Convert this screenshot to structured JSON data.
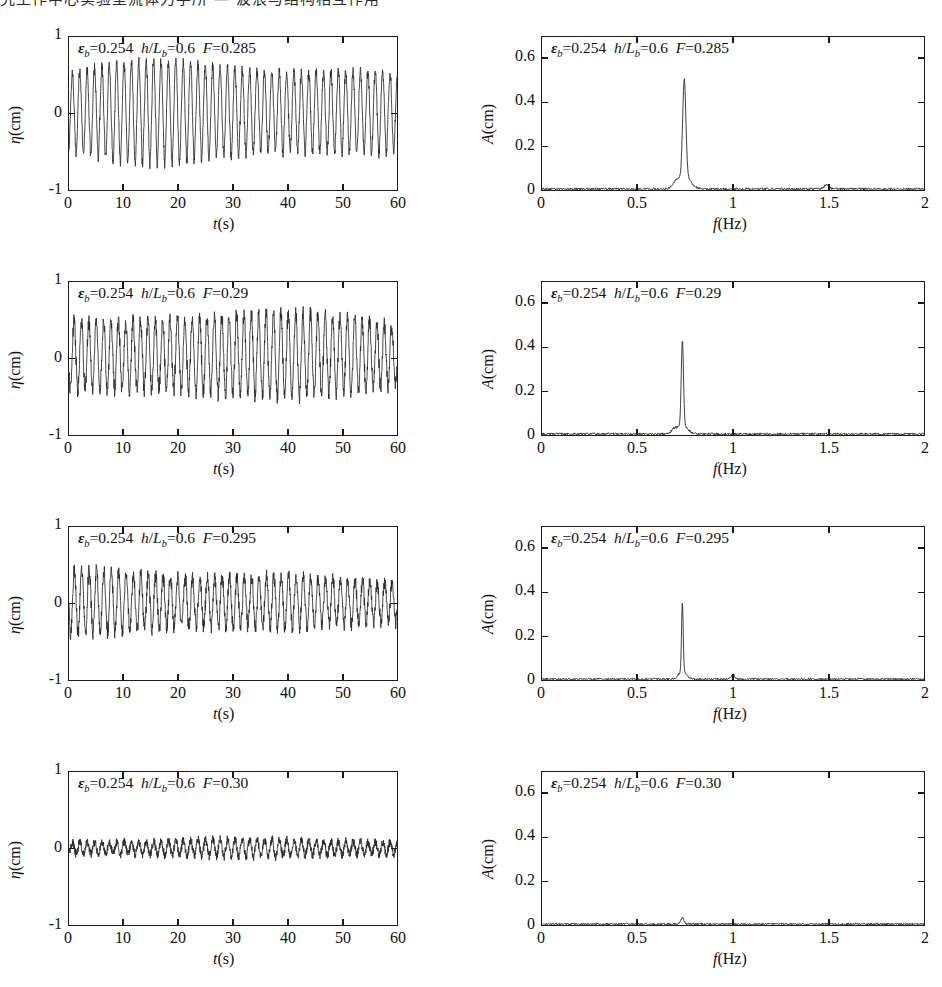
{
  "top_text_fragment": "究工作中心实验室流体力学所 — 波浪与结构相互作用",
  "figure": {
    "rows": [
      {
        "timeseries": {
          "annotation": {
            "eps_label": "ε",
            "eps_sub": "b",
            "eps_value": "0.254",
            "ratio_num": "h",
            "ratio_den": "L",
            "ratio_sub": "b",
            "ratio_value": "0.6",
            "F_label": "F",
            "F_value": "0.285"
          },
          "ylabel": "η(cm)",
          "xlabel": "t(s)",
          "ylim": [
            -1,
            1
          ],
          "xlim": [
            0,
            60
          ],
          "yticks": [
            "1",
            "0",
            "-1"
          ],
          "ytickvals": [
            1,
            0,
            -1
          ],
          "xticks": [
            "0",
            "10",
            "20",
            "30",
            "40",
            "50",
            "60"
          ],
          "xtickvals": [
            0,
            10,
            20,
            30,
            40,
            50,
            60
          ],
          "amplitude_top": 0.57,
          "amplitude_bottom": -0.55,
          "frequency": 0.74,
          "noise": 0.07,
          "samples": 1400
        },
        "spectrum": {
          "annotation": {
            "eps_label": "ε",
            "eps_sub": "b",
            "eps_value": "0.254",
            "ratio_num": "h",
            "ratio_den": "L",
            "ratio_sub": "b",
            "ratio_value": "0.6",
            "F_label": "F",
            "F_value": "0.285"
          },
          "ylabel": "A(cm)",
          "xlabel": "f(Hz)",
          "ylim": [
            0,
            0.7
          ],
          "xlim": [
            0,
            2
          ],
          "yticks": [
            "0.6",
            "0.4",
            "0.2",
            "0"
          ],
          "ytickvals": [
            0.6,
            0.4,
            0.2,
            0
          ],
          "xticks": [
            "0",
            "0.5",
            "1",
            "1.5",
            "2"
          ],
          "xtickvals": [
            0,
            0.5,
            1,
            1.5,
            2
          ],
          "peaks": [
            {
              "f": 0.745,
              "A": 0.445,
              "w": 0.012
            },
            {
              "f": 0.745,
              "A": 0.055,
              "w": 0.045
            },
            {
              "f": 1.49,
              "A": 0.018,
              "w": 0.018
            },
            {
              "f": 0.7,
              "A": 0.022,
              "w": 0.02
            }
          ],
          "baseline_noise": 0.009
        }
      },
      {
        "timeseries": {
          "annotation": {
            "eps_label": "ε",
            "eps_sub": "b",
            "eps_value": "0.254",
            "ratio_num": "h",
            "ratio_den": "L",
            "ratio_sub": "b",
            "ratio_value": "0.6",
            "F_label": "F",
            "F_value": "0.29"
          },
          "ylabel": "η(cm)",
          "xlabel": "t(s)",
          "ylim": [
            -1,
            1
          ],
          "xlim": [
            0,
            60
          ],
          "yticks": [
            "1",
            "0",
            "-1"
          ],
          "ytickvals": [
            1,
            0,
            -1
          ],
          "xticks": [
            "0",
            "10",
            "20",
            "30",
            "40",
            "50",
            "60"
          ],
          "xtickvals": [
            0,
            10,
            20,
            30,
            40,
            50,
            60
          ],
          "amplitude_top": 0.5,
          "amplitude_bottom": -0.42,
          "frequency": 0.74,
          "noise": 0.1,
          "samples": 1400
        },
        "spectrum": {
          "annotation": {
            "eps_label": "ε",
            "eps_sub": "b",
            "eps_value": "0.254",
            "ratio_num": "h",
            "ratio_den": "L",
            "ratio_sub": "b",
            "ratio_value": "0.6",
            "F_label": "F",
            "F_value": "0.29"
          },
          "ylabel": "A(cm)",
          "xlabel": "f(Hz)",
          "ylim": [
            0,
            0.7
          ],
          "xlim": [
            0,
            2
          ],
          "yticks": [
            "0.6",
            "0.4",
            "0.2",
            "0"
          ],
          "ytickvals": [
            0.6,
            0.4,
            0.2,
            0
          ],
          "xticks": [
            "0",
            "0.5",
            "1",
            "1.5",
            "2"
          ],
          "xtickvals": [
            0,
            0.5,
            1,
            1.5,
            2
          ],
          "peaks": [
            {
              "f": 0.735,
              "A": 0.385,
              "w": 0.008
            },
            {
              "f": 0.735,
              "A": 0.045,
              "w": 0.035
            },
            {
              "f": 0.69,
              "A": 0.018,
              "w": 0.018
            }
          ],
          "baseline_noise": 0.009
        }
      },
      {
        "timeseries": {
          "annotation": {
            "eps_label": "ε",
            "eps_sub": "b",
            "eps_value": "0.254",
            "ratio_num": "h",
            "ratio_den": "L",
            "ratio_sub": "b",
            "ratio_value": "0.6",
            "F_label": "F",
            "F_value": "0.295"
          },
          "ylabel": "η(cm)",
          "xlabel": "t(s)",
          "ylim": [
            -1,
            1
          ],
          "xlim": [
            0,
            60
          ],
          "yticks": [
            "1",
            "0",
            "-1"
          ],
          "ytickvals": [
            1,
            0,
            -1
          ],
          "xticks": [
            "0",
            "10",
            "20",
            "30",
            "40",
            "50",
            "60"
          ],
          "xtickvals": [
            0,
            10,
            20,
            30,
            40,
            50,
            60
          ],
          "amplitude_top": 0.36,
          "amplitude_bottom": -0.33,
          "frequency": 0.74,
          "noise": 0.09,
          "samples": 1400
        },
        "spectrum": {
          "annotation": {
            "eps_label": "ε",
            "eps_sub": "b",
            "eps_value": "0.254",
            "ratio_num": "h",
            "ratio_den": "L",
            "ratio_sub": "b",
            "ratio_value": "0.6",
            "F_label": "F",
            "F_value": "0.295"
          },
          "ylabel": "A(cm)",
          "xlabel": "f(Hz)",
          "ylim": [
            0,
            0.7
          ],
          "xlim": [
            0,
            2
          ],
          "yticks": [
            "0.6",
            "0.4",
            "0.2",
            "0"
          ],
          "ytickvals": [
            0.6,
            0.4,
            0.2,
            0
          ],
          "xticks": [
            "0",
            "0.5",
            "1",
            "1.5",
            "2"
          ],
          "xtickvals": [
            0,
            0.5,
            1,
            1.5,
            2
          ],
          "peaks": [
            {
              "f": 0.735,
              "A": 0.315,
              "w": 0.006
            },
            {
              "f": 0.735,
              "A": 0.035,
              "w": 0.028
            },
            {
              "f": 1.0,
              "A": 0.022,
              "w": 0.012
            }
          ],
          "baseline_noise": 0.008
        }
      },
      {
        "timeseries": {
          "annotation": {
            "eps_label": "ε",
            "eps_sub": "b",
            "eps_value": "0.254",
            "ratio_num": "h",
            "ratio_den": "L",
            "ratio_sub": "b",
            "ratio_value": "0.6",
            "F_label": "F",
            "F_value": "0.30"
          },
          "ylabel": "η(cm)",
          "xlabel": "t(s)",
          "ylim": [
            -1,
            1
          ],
          "xlim": [
            0,
            60
          ],
          "yticks": [
            "1",
            "0",
            "-1"
          ],
          "ytickvals": [
            1,
            0,
            -1
          ],
          "xticks": [
            "0",
            "10",
            "20",
            "30",
            "40",
            "50",
            "60"
          ],
          "xtickvals": [
            0,
            10,
            20,
            30,
            40,
            50,
            60
          ],
          "amplitude_top": 0.1,
          "amplitude_bottom": -0.09,
          "frequency": 0.74,
          "noise": 0.055,
          "samples": 1700
        },
        "spectrum": {
          "annotation": {
            "eps_label": "ε",
            "eps_sub": "b",
            "eps_value": "0.254",
            "ratio_num": "h",
            "ratio_den": "L",
            "ratio_sub": "b",
            "ratio_value": "0.6",
            "F_label": "F",
            "F_value": "0.30"
          },
          "ylabel": "A(cm)",
          "xlabel": "f(Hz)",
          "ylim": [
            0,
            0.7
          ],
          "xlim": [
            0,
            2
          ],
          "yticks": [
            "0.6",
            "0.4",
            "0.2",
            "0"
          ],
          "ytickvals": [
            0.6,
            0.4,
            0.2,
            0
          ],
          "xticks": [
            "0",
            "0.5",
            "1",
            "1.5",
            "2"
          ],
          "xtickvals": [
            0,
            0.5,
            1,
            1.5,
            2
          ],
          "peaks": [
            {
              "f": 0.735,
              "A": 0.028,
              "w": 0.012
            }
          ],
          "baseline_noise": 0.008
        }
      }
    ]
  },
  "chart_data": [
    {
      "type": "line",
      "title": "εb=0.254  h/Lb=0.6  F=0.285",
      "xlabel": "t(s)",
      "ylabel": "η(cm)",
      "xlim": [
        0,
        60
      ],
      "ylim": [
        -1,
        1
      ],
      "xticks": [
        0,
        10,
        20,
        30,
        40,
        50,
        60
      ],
      "yticks": [
        -1,
        0,
        1
      ],
      "description": "Periodic wave elevation, near-sinusoidal, crest ~ +0.57 cm, trough ~ -0.55 cm, dominant period ~1.35 s",
      "grid": false,
      "legend": "none"
    },
    {
      "type": "line",
      "title": "εb=0.254  h/Lb=0.6  F=0.285",
      "xlabel": "f(Hz)",
      "ylabel": "A(cm)",
      "xlim": [
        0,
        2
      ],
      "ylim": [
        0,
        0.7
      ],
      "xticks": [
        0,
        0.5,
        1,
        1.5,
        2
      ],
      "yticks": [
        0,
        0.2,
        0.4,
        0.6
      ],
      "peak_frequency": 0.745,
      "peak_amplitude": 0.445,
      "secondary_peaks": [
        {
          "f": 1.49,
          "A": 0.02
        }
      ],
      "grid": false,
      "legend": "none"
    },
    {
      "type": "line",
      "title": "εb=0.254  h/Lb=0.6  F=0.29",
      "xlabel": "t(s)",
      "ylabel": "η(cm)",
      "xlim": [
        0,
        60
      ],
      "ylim": [
        -1,
        1
      ],
      "xticks": [
        0,
        10,
        20,
        30,
        40,
        50,
        60
      ],
      "yticks": [
        -1,
        0,
        1
      ],
      "description": "Quasi-periodic wave elevation, crest ~ +0.50 cm, trough ~ -0.45 cm, modulated amplitude",
      "grid": false,
      "legend": "none"
    },
    {
      "type": "line",
      "title": "εb=0.254  h/Lb=0.6  F=0.29",
      "xlabel": "f(Hz)",
      "ylabel": "A(cm)",
      "xlim": [
        0,
        2
      ],
      "ylim": [
        0,
        0.7
      ],
      "xticks": [
        0,
        0.5,
        1,
        1.5,
        2
      ],
      "yticks": [
        0,
        0.2,
        0.4,
        0.6
      ],
      "peak_frequency": 0.735,
      "peak_amplitude": 0.385,
      "secondary_peaks": [],
      "grid": false,
      "legend": "none"
    },
    {
      "type": "line",
      "title": "εb=0.254  h/Lb=0.6  F=0.295",
      "xlabel": "t(s)",
      "ylabel": "η(cm)",
      "xlim": [
        0,
        60
      ],
      "ylim": [
        -1,
        1
      ],
      "xticks": [
        0,
        10,
        20,
        30,
        40,
        50,
        60
      ],
      "yticks": [
        -1,
        0,
        1
      ],
      "description": "Reduced amplitude oscillation, crest ~ +0.36 cm, trough ~ -0.35 cm",
      "grid": false,
      "legend": "none"
    },
    {
      "type": "line",
      "title": "εb=0.254  h/Lb=0.6  F=0.295",
      "xlabel": "f(Hz)",
      "ylabel": "A(cm)",
      "xlim": [
        0,
        2
      ],
      "ylim": [
        0,
        0.7
      ],
      "xticks": [
        0,
        0.5,
        1,
        1.5,
        2
      ],
      "yticks": [
        0,
        0.2,
        0.4,
        0.6
      ],
      "peak_frequency": 0.735,
      "peak_amplitude": 0.315,
      "secondary_peaks": [
        {
          "f": 1.0,
          "A": 0.022
        }
      ],
      "grid": false,
      "legend": "none"
    },
    {
      "type": "line",
      "title": "εb=0.254  h/Lb=0.6  F=0.30",
      "xlabel": "t(s)",
      "ylabel": "η(cm)",
      "xlim": [
        0,
        60
      ],
      "ylim": [
        -1,
        1
      ],
      "xticks": [
        0,
        10,
        20,
        30,
        40,
        50,
        60
      ],
      "yticks": [
        -1,
        0,
        1
      ],
      "description": "Low-amplitude irregular noise band about zero, |η| < 0.15 cm",
      "grid": false,
      "legend": "none"
    },
    {
      "type": "line",
      "title": "εb=0.254  h/Lb=0.6  F=0.30",
      "xlabel": "f(Hz)",
      "ylabel": "A(cm)",
      "xlim": [
        0,
        2
      ],
      "ylim": [
        0,
        0.7
      ],
      "xticks": [
        0,
        0.5,
        1,
        1.5,
        2
      ],
      "yticks": [
        0,
        0.2,
        0.4,
        0.6
      ],
      "peak_frequency": 0.735,
      "peak_amplitude": 0.03,
      "secondary_peaks": [],
      "grid": false,
      "legend": "none"
    }
  ]
}
